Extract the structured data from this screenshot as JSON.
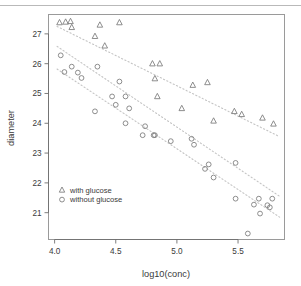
{
  "chart_data": {
    "type": "scatter",
    "title": "",
    "xlabel": "log10(conc)",
    "ylabel": "diameter",
    "xlim": [
      3.95,
      5.88
    ],
    "ylim": [
      20.1,
      27.65
    ],
    "xticks": [
      "4.0",
      "4.5",
      "5.0",
      "5.5"
    ],
    "xtick_values": [
      4.0,
      4.5,
      5.0,
      5.5
    ],
    "yticks": [
      "21",
      "22",
      "23",
      "24",
      "25",
      "26",
      "27"
    ],
    "ytick_values": [
      21,
      22,
      23,
      24,
      25,
      26,
      27
    ],
    "grid": false,
    "legend_position": "bottom-left",
    "series": [
      {
        "name": "with glucose",
        "marker": "triangle",
        "color": "#7a7a7a",
        "points": [
          [
            4.04,
            27.38
          ],
          [
            4.09,
            27.4
          ],
          [
            4.13,
            27.42
          ],
          [
            4.14,
            27.22
          ],
          [
            4.33,
            26.92
          ],
          [
            4.37,
            27.3
          ],
          [
            4.41,
            26.6
          ],
          [
            4.53,
            27.38
          ],
          [
            4.8,
            26.0
          ],
          [
            4.82,
            25.5
          ],
          [
            4.86,
            26.0
          ],
          [
            4.84,
            24.9
          ],
          [
            5.04,
            24.5
          ],
          [
            5.13,
            25.28
          ],
          [
            5.25,
            25.37
          ],
          [
            5.3,
            24.08
          ],
          [
            5.47,
            24.4
          ],
          [
            5.53,
            24.3
          ],
          [
            5.7,
            24.18
          ],
          [
            5.79,
            23.98
          ]
        ],
        "trendline": {
          "x0": 4.02,
          "y0": 27.25,
          "x1": 5.84,
          "y1": 23.55,
          "style": "dotted"
        }
      },
      {
        "name": "without glucose",
        "marker": "circle",
        "color": "#7a7a7a",
        "points": [
          [
            4.05,
            26.28
          ],
          [
            4.08,
            25.72
          ],
          [
            4.14,
            25.9
          ],
          [
            4.19,
            25.7
          ],
          [
            4.22,
            25.52
          ],
          [
            4.33,
            24.4
          ],
          [
            4.35,
            25.9
          ],
          [
            4.47,
            24.9
          ],
          [
            4.5,
            24.62
          ],
          [
            4.53,
            25.4
          ],
          [
            4.58,
            24.9
          ],
          [
            4.58,
            24.0
          ],
          [
            4.61,
            24.5
          ],
          [
            4.72,
            23.6
          ],
          [
            4.74,
            23.9
          ],
          [
            4.81,
            23.6
          ],
          [
            4.82,
            23.6
          ],
          [
            4.95,
            23.4
          ],
          [
            5.12,
            23.48
          ],
          [
            5.14,
            23.28
          ],
          [
            5.23,
            22.47
          ],
          [
            5.26,
            22.62
          ],
          [
            5.3,
            22.18
          ],
          [
            5.48,
            22.67
          ],
          [
            5.48,
            21.47
          ],
          [
            5.58,
            20.3
          ],
          [
            5.63,
            21.27
          ],
          [
            5.67,
            21.47
          ],
          [
            5.68,
            20.97
          ],
          [
            5.74,
            21.25
          ],
          [
            5.76,
            21.18
          ],
          [
            5.78,
            21.47
          ]
        ],
        "trendline": {
          "x0": 4.02,
          "y0": 25.82,
          "x1": 5.84,
          "y1": 20.85,
          "style": "dotted"
        },
        "trendline2": {
          "x0": 4.02,
          "y0": 26.58,
          "x1": 5.84,
          "y1": 21.55,
          "style": "dotted"
        }
      }
    ]
  },
  "legend": {
    "items": [
      {
        "label": "with glucose",
        "marker": "triangle"
      },
      {
        "label": "without glucose",
        "marker": "circle"
      }
    ]
  }
}
